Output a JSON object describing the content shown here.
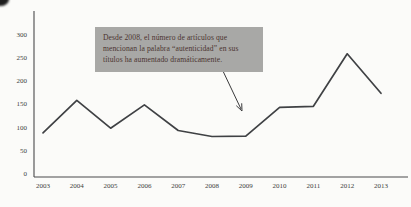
{
  "chart_data": {
    "type": "line",
    "categories": [
      "2003",
      "2004",
      "2005",
      "2006",
      "2007",
      "2008",
      "2009",
      "2010",
      "2011",
      "2012",
      "2013"
    ],
    "values": [
      95,
      165,
      105,
      155,
      100,
      87,
      88,
      150,
      152,
      265,
      180
    ],
    "title": "",
    "xlabel": "",
    "ylabel": "",
    "ylim": [
      0,
      300
    ],
    "yticks": [
      0,
      50,
      100,
      150,
      200,
      250,
      300
    ],
    "grid": false,
    "legend": "none",
    "line_color": "#3f4144",
    "annotation_points_to": "2009"
  },
  "annotation": {
    "text": "Desde 2008, el número de artículos que mencionan la palabra “autenticidad” en sus títulos ha aumentado dramáticamente.",
    "bg_color": "#a8a8a6",
    "text_color": "#4b3430"
  },
  "colors": {
    "background": "#fbfbf9",
    "axis": "#4a4a4c",
    "tick_text": "#3e3e40",
    "arrow": "#3a3a3c"
  }
}
